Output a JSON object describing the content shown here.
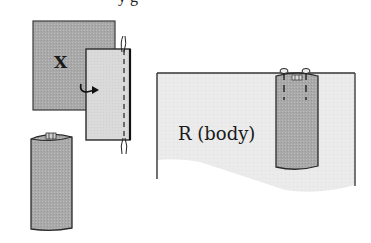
{
  "figure": {
    "caption_partial": "y    g",
    "panel_x": {
      "label": "X",
      "description": "square fabric piece with folded strip stitched along edge"
    },
    "panel_tube": {
      "description": "strip sewn into tube"
    },
    "panel_body": {
      "label": "R (body)",
      "description": "tube pinned onto body piece"
    },
    "icons": [
      "curved-arrow-icon",
      "thread-end-icon",
      "pin-icon"
    ],
    "colors": {
      "dark_fabric": "#a8a8a8",
      "light_fabric": "#dcdcdc",
      "body_fabric": "#e9e9e9",
      "outline": "#2a2a2a"
    }
  }
}
